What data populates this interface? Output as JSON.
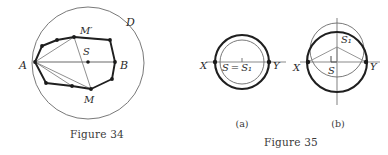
{
  "figures": [
    {
      "id": "figure-34",
      "caption": "Figure 34",
      "labels": {
        "disk": "ᵉD",
        "disk_plain": "D",
        "point_A": "A",
        "point_B": "B",
        "point_S": "S",
        "point_M": "M",
        "point_M_prime": "M′"
      },
      "geometry": {
        "circle": {
          "cx": 88,
          "cy": 63,
          "r": 56
        },
        "polygon": [
          [
            35,
            62
          ],
          [
            42,
            46
          ],
          [
            57,
            40
          ],
          [
            74,
            37
          ],
          [
            110,
            40
          ],
          [
            115,
            62
          ],
          [
            112,
            79
          ],
          [
            91,
            89
          ],
          [
            72,
            86
          ],
          [
            46,
            83
          ]
        ],
        "chord_AB": [
          [
            35,
            62
          ],
          [
            115,
            62
          ]
        ],
        "point_S": [
          88,
          62
        ],
        "point_M": [
          91,
          89
        ],
        "point_M_prime": [
          74,
          37
        ]
      }
    },
    {
      "id": "figure-35",
      "caption": "Figure 35",
      "panels": [
        {
          "id": "figure-35a",
          "caption": "(a)",
          "labels": {
            "point_X": "X",
            "point_Y": "Y",
            "center_equality": "S = S₁",
            "center_S": "S",
            "center_S1": "S₁"
          },
          "geometry": {
            "outer_circle": {
              "cx": 48,
              "cy": 62,
              "r": 27
            },
            "inner_circle": {
              "cx": 48,
              "cy": 62,
              "r": 22
            },
            "axis_XY": [
              [
                12,
                62
              ],
              [
                90,
                62
              ]
            ],
            "point_X": [
              21,
              62
            ],
            "point_Y": [
              75,
              62
            ],
            "center": [
              48,
              62
            ]
          }
        },
        {
          "id": "figure-35b",
          "caption": "(b)",
          "labels": {
            "point_X": "X",
            "point_Y": "Y",
            "center_S": "S",
            "center_S1": "S₁",
            "right_angle": "∟"
          },
          "geometry": {
            "main_circle": {
              "cx": 143,
              "cy": 62,
              "r": 30
            },
            "offset_circle": {
              "cx": 143,
              "cy": 50,
              "r": 27
            },
            "axis_XY": [
              [
                108,
                62
              ],
              [
                182,
                62
              ]
            ],
            "axis_vertical": [
              [
                143,
                18
              ],
              [
                143,
                105
              ]
            ],
            "point_X": [
              114,
              62
            ],
            "point_Y": [
              172,
              62
            ],
            "center_S": [
              143,
              62
            ],
            "center_S1": [
              143,
              47
            ],
            "spokes": [
              [
                [
                  143,
                  47
                ],
                [
                  114,
                  62
                ]
              ],
              [
                [
                  143,
                  47
                ],
                [
                  172,
                  62
                ]
              ],
              [
                [
                  143,
                  47
                ],
                [
                  143,
                  62
                ]
              ]
            ],
            "right_angle_marker": [
              143,
              62
            ]
          }
        }
      ]
    }
  ],
  "colors": {
    "ink": "#2b2b2b",
    "thin_line": "#555555",
    "light_line": "#a8a8a8",
    "chord_gray": "#b4b4b4",
    "background": "#ffffff"
  }
}
